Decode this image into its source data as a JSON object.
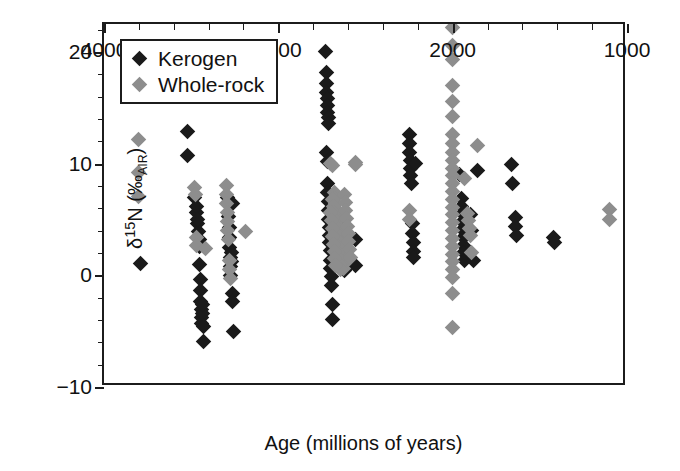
{
  "chart_data": {
    "type": "scatter",
    "title": "",
    "xlabel": "Age (millions of years)",
    "ylabel": "δ15N (‰AIR)",
    "ylabel_parts": {
      "delta": "δ",
      "mass": "15",
      "element": "N",
      "unit_open": " (‰",
      "unit_sub": "AIR",
      "unit_close": ")"
    },
    "xlim": [
      4000,
      1000
    ],
    "x_reversed": true,
    "ylim": [
      -10,
      22.5
    ],
    "x_ticks": [
      4000,
      3000,
      2000,
      1000
    ],
    "x_tick_labels": [
      "4000",
      "3000",
      "2000",
      "1000"
    ],
    "x_minor_step": 200,
    "y_ticks": [
      -10,
      0,
      10,
      20
    ],
    "y_tick_labels": [
      "−10",
      "0",
      "10",
      "20"
    ],
    "y_minor_step": 2,
    "grid": false,
    "legend_position": "upper-left",
    "colors": {
      "kerogen": "#1a1a1a",
      "wholerock": "#8d8d8d",
      "axis": "#1c1c1c",
      "background": "#ffffff"
    },
    "marker": "diamond",
    "series": [
      {
        "name": "Kerogen",
        "color": "#1a1a1a",
        "points": [
          [
            3790,
            1.1
          ],
          [
            3520,
            12.9
          ],
          [
            3520,
            10.7
          ],
          [
            3480,
            7.0
          ],
          [
            3470,
            5.6
          ],
          [
            3465,
            4.6
          ],
          [
            3460,
            3.9
          ],
          [
            3455,
            3.2
          ],
          [
            3450,
            2.6
          ],
          [
            3450,
            1.0
          ],
          [
            3448,
            -0.4
          ],
          [
            3446,
            -1.4
          ],
          [
            3444,
            -2.3
          ],
          [
            3442,
            -3.1
          ],
          [
            3440,
            -3.8
          ],
          [
            3438,
            -4.3
          ],
          [
            3436,
            -3.4
          ],
          [
            3434,
            -2.6
          ],
          [
            3432,
            -4.6
          ],
          [
            3430,
            -5.9
          ],
          [
            3470,
            6.2
          ],
          [
            3465,
            5.0
          ],
          [
            3290,
            7.0
          ],
          [
            3285,
            5.3
          ],
          [
            3282,
            4.3
          ],
          [
            3280,
            3.4
          ],
          [
            3278,
            2.5
          ],
          [
            3276,
            1.6
          ],
          [
            3274,
            0.8
          ],
          [
            3272,
            0.0
          ],
          [
            3270,
            2.0
          ],
          [
            3268,
            1.2
          ],
          [
            3265,
            -1.6
          ],
          [
            3263,
            -2.3
          ],
          [
            3260,
            -5.0
          ],
          [
            3265,
            6.4
          ],
          [
            2730,
            20.0
          ],
          [
            2726,
            18.2
          ],
          [
            2724,
            17.2
          ],
          [
            2722,
            16.4
          ],
          [
            2720,
            15.8
          ],
          [
            2718,
            15.2
          ],
          [
            2716,
            14.6
          ],
          [
            2714,
            14.1
          ],
          [
            2712,
            13.6
          ],
          [
            2722,
            11.0
          ],
          [
            2720,
            10.2
          ],
          [
            2718,
            8.2
          ],
          [
            2716,
            7.4
          ],
          [
            2714,
            6.6
          ],
          [
            2712,
            5.8
          ],
          [
            2710,
            5.0
          ],
          [
            2708,
            4.3
          ],
          [
            2706,
            3.6
          ],
          [
            2704,
            2.9
          ],
          [
            2702,
            2.2
          ],
          [
            2700,
            1.3
          ],
          [
            2698,
            0.6
          ],
          [
            2696,
            -0.1
          ],
          [
            2694,
            -0.9
          ],
          [
            2690,
            -2.6
          ],
          [
            2688,
            -4.0
          ],
          [
            2660,
            4.8
          ],
          [
            2640,
            2.4
          ],
          [
            2630,
            0.8
          ],
          [
            2620,
            0.4
          ],
          [
            2600,
            3.4
          ],
          [
            2590,
            1.0
          ],
          [
            2560,
            3.2
          ],
          [
            2555,
            0.9
          ],
          [
            2250,
            12.6
          ],
          [
            2248,
            11.8
          ],
          [
            2246,
            11.0
          ],
          [
            2244,
            10.3
          ],
          [
            2242,
            9.6
          ],
          [
            2240,
            8.9
          ],
          [
            2238,
            8.2
          ],
          [
            2230,
            4.6
          ],
          [
            2228,
            3.7
          ],
          [
            2226,
            2.9
          ],
          [
            2224,
            2.1
          ],
          [
            2222,
            1.6
          ],
          [
            2215,
            10.0
          ],
          [
            1960,
            9.0
          ],
          [
            1950,
            6.9
          ],
          [
            1948,
            6.2
          ],
          [
            1946,
            5.5
          ],
          [
            1944,
            4.8
          ],
          [
            1942,
            4.1
          ],
          [
            1940,
            3.4
          ],
          [
            1938,
            2.7
          ],
          [
            1936,
            2.0
          ],
          [
            1934,
            1.3
          ],
          [
            1930,
            4.6
          ],
          [
            1925,
            3.6
          ],
          [
            1900,
            5.4
          ],
          [
            1890,
            4.0
          ],
          [
            1880,
            1.3
          ],
          [
            1860,
            9.4
          ],
          [
            1660,
            9.9
          ],
          [
            1655,
            8.2
          ],
          [
            1640,
            5.2
          ],
          [
            1638,
            4.4
          ],
          [
            1636,
            3.6
          ],
          [
            1420,
            3.4
          ],
          [
            1415,
            2.9
          ]
        ]
      },
      {
        "name": "Whole-rock",
        "color": "#8d8d8d",
        "points": [
          [
            3800,
            12.2
          ],
          [
            3800,
            9.2
          ],
          [
            3800,
            7.1
          ],
          [
            3480,
            7.9
          ],
          [
            3478,
            7.2
          ],
          [
            3470,
            3.4
          ],
          [
            3468,
            2.7
          ],
          [
            3420,
            2.4
          ],
          [
            3300,
            8.0
          ],
          [
            3298,
            7.2
          ],
          [
            3296,
            6.4
          ],
          [
            3294,
            5.6
          ],
          [
            3292,
            4.8
          ],
          [
            3290,
            4.0
          ],
          [
            3288,
            3.2
          ],
          [
            3280,
            1.3
          ],
          [
            3278,
            0.5
          ],
          [
            3276,
            -0.3
          ],
          [
            3190,
            3.9
          ],
          [
            2700,
            10.0
          ],
          [
            2690,
            9.8
          ],
          [
            2680,
            7.4
          ],
          [
            2676,
            6.9
          ],
          [
            2672,
            6.4
          ],
          [
            2668,
            5.9
          ],
          [
            2664,
            5.4
          ],
          [
            2660,
            4.9
          ],
          [
            2656,
            4.4
          ],
          [
            2652,
            3.9
          ],
          [
            2648,
            3.4
          ],
          [
            2644,
            2.9
          ],
          [
            2640,
            2.4
          ],
          [
            2636,
            1.9
          ],
          [
            2632,
            1.4
          ],
          [
            2628,
            1.0
          ],
          [
            2624,
            0.6
          ],
          [
            2690,
            6.8
          ],
          [
            2686,
            6.2
          ],
          [
            2682,
            5.6
          ],
          [
            2678,
            5.0
          ],
          [
            2674,
            4.4
          ],
          [
            2670,
            3.8
          ],
          [
            2666,
            3.2
          ],
          [
            2662,
            2.6
          ],
          [
            2658,
            2.0
          ],
          [
            2654,
            1.5
          ],
          [
            2650,
            1.0
          ],
          [
            2646,
            0.5
          ],
          [
            2700,
            5.6
          ],
          [
            2696,
            4.9
          ],
          [
            2692,
            4.2
          ],
          [
            2688,
            3.5
          ],
          [
            2684,
            2.8
          ],
          [
            2680,
            2.1
          ],
          [
            2676,
            1.5
          ],
          [
            2672,
            0.9
          ],
          [
            2620,
            7.2
          ],
          [
            2616,
            6.5
          ],
          [
            2612,
            5.8
          ],
          [
            2608,
            5.1
          ],
          [
            2604,
            4.4
          ],
          [
            2600,
            3.7
          ],
          [
            2596,
            3.0
          ],
          [
            2592,
            2.3
          ],
          [
            2588,
            1.6
          ],
          [
            2560,
            10.1
          ],
          [
            2555,
            9.9
          ],
          [
            2250,
            5.8
          ],
          [
            2246,
            5.0
          ],
          [
            2000,
            22.2
          ],
          [
            2000,
            20.6
          ],
          [
            2000,
            19.3
          ],
          [
            2000,
            17.0
          ],
          [
            2000,
            15.6
          ],
          [
            2000,
            14.2
          ],
          [
            2000,
            12.6
          ],
          [
            2000,
            11.8
          ],
          [
            2000,
            11.0
          ],
          [
            2000,
            10.3
          ],
          [
            2000,
            9.6
          ],
          [
            2000,
            8.9
          ],
          [
            2000,
            8.2
          ],
          [
            2000,
            7.5
          ],
          [
            2000,
            6.8
          ],
          [
            2000,
            6.1
          ],
          [
            2000,
            5.4
          ],
          [
            2000,
            4.7
          ],
          [
            2000,
            4.0
          ],
          [
            2000,
            3.3
          ],
          [
            2000,
            2.6
          ],
          [
            2000,
            1.9
          ],
          [
            2000,
            1.2
          ],
          [
            2000,
            0.5
          ],
          [
            2000,
            -0.2
          ],
          [
            2000,
            -1.6
          ],
          [
            2000,
            -4.7
          ],
          [
            1930,
            8.7
          ],
          [
            1915,
            5.5
          ],
          [
            1910,
            4.9
          ],
          [
            1905,
            4.2
          ],
          [
            1900,
            3.6
          ],
          [
            1890,
            2.0
          ],
          [
            1860,
            11.6
          ],
          [
            1100,
            5.9
          ],
          [
            1100,
            5.0
          ]
        ]
      }
    ]
  },
  "legend": {
    "items": [
      {
        "label": "Kerogen",
        "color": "#1a1a1a"
      },
      {
        "label": "Whole-rock",
        "color": "#8d8d8d"
      }
    ]
  }
}
